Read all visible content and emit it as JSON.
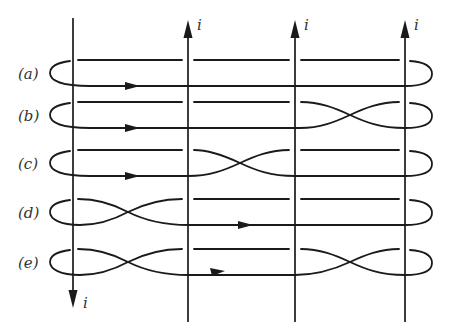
{
  "diagram": {
    "title": "",
    "wire_label": "i",
    "wires": [
      {
        "id": "w1",
        "x": 73,
        "direction": "down",
        "label": "i"
      },
      {
        "id": "w2",
        "x": 188,
        "direction": "up",
        "label": "i"
      },
      {
        "id": "w3",
        "x": 295,
        "direction": "up",
        "label": "i"
      },
      {
        "id": "w4",
        "x": 405,
        "direction": "up",
        "label": "i"
      }
    ],
    "rows": [
      {
        "id": "a",
        "label": "(a)",
        "crossings": []
      },
      {
        "id": "b",
        "label": "(b)",
        "crossings": [
          "between w3 and w4"
        ]
      },
      {
        "id": "c",
        "label": "(c)",
        "crossings": [
          "between w2 and w3"
        ]
      },
      {
        "id": "d",
        "label": "(d)",
        "crossings": [
          "between w1 and w2"
        ]
      },
      {
        "id": "e",
        "label": "(e)",
        "crossings": [
          "between w1 and w2",
          "between w3 and w4"
        ]
      }
    ]
  }
}
